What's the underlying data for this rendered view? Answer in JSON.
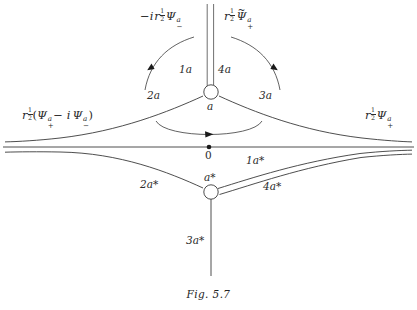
{
  "figure": {
    "caption": "Fig. 5.7",
    "background_color": "#ffffff",
    "ink_color": "#2b2b2b"
  },
  "axis": {
    "origin_label": "0",
    "origin_marker": "filled-dot"
  },
  "vertices": [
    {
      "id": "upper",
      "label": "a",
      "marker": "open-circle",
      "x": 211,
      "y": 92
    },
    {
      "id": "lower",
      "label": "a*",
      "marker": "open-circle",
      "x": 211,
      "y": 192
    }
  ],
  "branch_labels": {
    "upper": [
      {
        "name": "1a",
        "text": "1a"
      },
      {
        "name": "4a",
        "text": "4a"
      },
      {
        "name": "2a",
        "text": "2a"
      },
      {
        "name": "3a",
        "text": "3a"
      }
    ],
    "lower": [
      {
        "name": "1a-star",
        "text": "1a*"
      },
      {
        "name": "4a-star",
        "text": "4a*"
      },
      {
        "name": "2a-star",
        "text": "2a*"
      },
      {
        "name": "3a-star",
        "text": "3a*"
      }
    ]
  },
  "wave_labels": {
    "top_left": {
      "name": "minus-i-r-half-psi-minus-a",
      "plain": "-i r^(1/2) Psi_-^a",
      "parts": {
        "lead": "−i",
        "r": "r",
        "exp_num": "1",
        "exp_den": "2",
        "psi": "Ψ",
        "sup": "a",
        "sub": "−"
      }
    },
    "top_right": {
      "name": "r-half-psi-tilde-plus-a",
      "plain": "r^(1/2) Psi~_+^a",
      "parts": {
        "r": "r",
        "exp_num": "1",
        "exp_den": "2",
        "psi": "Ψ",
        "tilde": "~",
        "sup": "a",
        "sub": "+"
      }
    },
    "left": {
      "name": "r-half-psi-plus-a-minus-i-psi-minus-a",
      "plain": "r^(1/2)(Psi_+^a - i Psi_-^a)",
      "parts": {
        "r": "r",
        "exp_num": "1",
        "exp_den": "2",
        "open": "(",
        "psi1": "Ψ",
        "sup1": "a",
        "sub1": "+",
        "minus": "−",
        "i": "i",
        "psi2": "Ψ",
        "sup2": "a",
        "sub2": "−",
        "close": ")"
      }
    },
    "right": {
      "name": "r-half-psi-plus-a",
      "plain": "r^(1/2) Psi_+^a",
      "parts": {
        "r": "r",
        "exp_num": "1",
        "exp_den": "2",
        "psi": "Ψ",
        "sup": "a",
        "sub": "+"
      }
    }
  },
  "arcs": [
    {
      "name": "arc-upper-left",
      "direction": "counterclockwise",
      "arrow": "down-left"
    },
    {
      "name": "arc-upper-right",
      "direction": "clockwise",
      "arrow": "down-right"
    },
    {
      "name": "arc-center",
      "direction": "rightward",
      "arrow": "right"
    }
  ]
}
